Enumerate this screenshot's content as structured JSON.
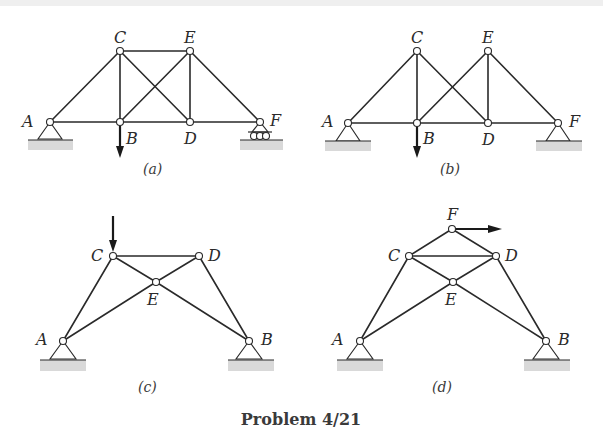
{
  "caption": "Problem 4/21",
  "colors": {
    "line": "#2a2a2a",
    "ground": "#d9d9d9",
    "background": "#ffffff"
  },
  "trusses": [
    {
      "id": "a",
      "label": "(a)",
      "nodes": {
        "A": "A",
        "B": "B",
        "C": "C",
        "D": "D",
        "E": "E",
        "F": "F"
      },
      "members": [
        "AB",
        "BD",
        "DF",
        "AC",
        "CE",
        "EF",
        "CB",
        "ED",
        "CD",
        "BE"
      ],
      "supports": {
        "A": "pin",
        "F": "roller"
      },
      "load": {
        "at": "B",
        "direction": "down"
      }
    },
    {
      "id": "b",
      "label": "(b)",
      "nodes": {
        "A": "A",
        "B": "B",
        "C": "C",
        "D": "D",
        "E": "E",
        "F": "F"
      },
      "members": [
        "AB",
        "BD",
        "DF",
        "AC",
        "CB",
        "CD",
        "BE",
        "ED",
        "EF"
      ],
      "supports": {
        "A": "pin",
        "F": "pin"
      },
      "load": {
        "at": "B",
        "direction": "down"
      }
    },
    {
      "id": "c",
      "label": "(c)",
      "nodes": {
        "A": "A",
        "B": "B",
        "C": "C",
        "D": "D",
        "E": "E"
      },
      "members": [
        "AC",
        "CD",
        "DB",
        "CE",
        "EB",
        "AE",
        "ED"
      ],
      "supports": {
        "A": "pin",
        "B": "pin"
      },
      "load": {
        "at": "C",
        "direction": "down"
      }
    },
    {
      "id": "d",
      "label": "(d)",
      "nodes": {
        "A": "A",
        "B": "B",
        "C": "C",
        "D": "D",
        "E": "E",
        "F": "F"
      },
      "members": [
        "AC",
        "CD",
        "DB",
        "CE",
        "EB",
        "AE",
        "ED",
        "CF",
        "FD"
      ],
      "supports": {
        "A": "pin",
        "B": "pin"
      },
      "load": {
        "at": "F",
        "direction": "right"
      }
    }
  ]
}
